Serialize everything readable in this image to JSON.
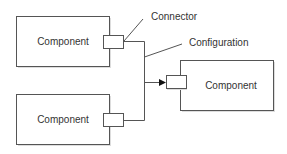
{
  "diagram": {
    "components": [
      {
        "id": "comp-top-left",
        "label": "Component"
      },
      {
        "id": "comp-bottom-left",
        "label": "Component"
      },
      {
        "id": "comp-right",
        "label": "Component"
      }
    ],
    "annotations": {
      "connector": "Connector",
      "configuration": "Configuration"
    },
    "colors": {
      "stroke": "#555555",
      "text": "#333333",
      "background": "#ffffff",
      "shadow": "#cccccc"
    }
  }
}
